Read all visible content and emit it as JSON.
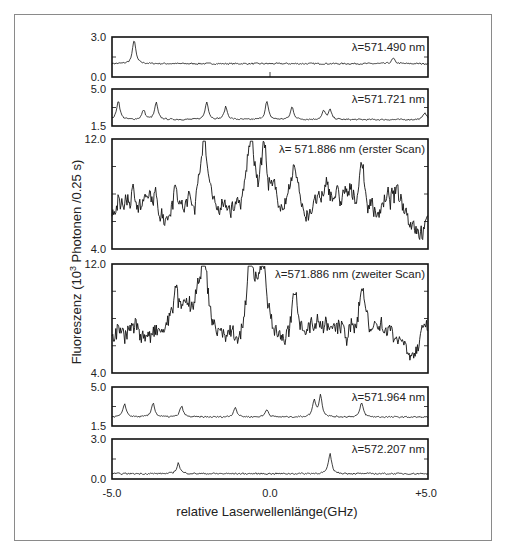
{
  "figure": {
    "ylabel": "Fluoreszenz (10³ Photonen /0.25 s)",
    "ylabel_parts": {
      "pre": "Fluoreszenz (10",
      "sup": "3",
      "post": " Photonen /0.25 s)"
    },
    "xlabel": "relative Laserwellenlänge(GHz)",
    "xticks": [
      "-5.0",
      "0.0",
      "+5.0"
    ]
  },
  "panels": [
    {
      "label": "λ=571.490 nm",
      "ymax": "3.0",
      "ymin": "0.0"
    },
    {
      "label": "λ=571.721 nm",
      "ymax": "5.0",
      "ymin": "1.5"
    },
    {
      "label": "λ= 571.886 nm (erster Scan)",
      "ymax": "12.0",
      "ymin": "4.0"
    },
    {
      "label": "λ=571.886 nm (zweiter Scan)",
      "ymax": "12.0",
      "ymin": "4.0"
    },
    {
      "label": "λ=571.964 nm",
      "ymax": "5.0",
      "ymin": "1.5"
    },
    {
      "label": "λ=572.207 nm",
      "ymax": "3.0",
      "ymin": "0.0"
    }
  ],
  "chart_data": {
    "type": "line",
    "title": "",
    "xlabel": "relative Laserwellenlänge(GHz)",
    "ylabel": "Fluoreszenz (10^3 Photonen /0.25 s)",
    "xlim": [
      -5.0,
      5.0
    ],
    "xticks": [
      -5.0,
      0.0,
      5.0
    ],
    "grid": false,
    "legend": "none (inline panel annotations)",
    "subplots": [
      {
        "annotation": "λ=571.490 nm",
        "ylim": [
          0.0,
          3.0
        ],
        "baseline": 1.0,
        "peaks": [
          {
            "x": -4.3,
            "y": 2.8
          },
          {
            "x": 3.9,
            "y": 1.4
          }
        ]
      },
      {
        "annotation": "λ=571.721 nm",
        "ylim": [
          1.5,
          5.0
        ],
        "baseline": 2.1,
        "peaks": [
          {
            "x": -4.8,
            "y": 3.9
          },
          {
            "x": -4.0,
            "y": 3.0
          },
          {
            "x": -3.6,
            "y": 3.7
          },
          {
            "x": -2.0,
            "y": 3.8
          },
          {
            "x": -1.4,
            "y": 3.3
          },
          {
            "x": -0.1,
            "y": 3.8
          },
          {
            "x": 0.7,
            "y": 3.3
          },
          {
            "x": 1.7,
            "y": 2.9
          },
          {
            "x": 1.9,
            "y": 3.0
          },
          {
            "x": 4.9,
            "y": 2.8
          }
        ]
      },
      {
        "annotation": "λ= 571.886 nm (erster Scan)",
        "ylim": [
          4.0,
          12.0
        ],
        "baseline": 7.0,
        "peaks": [
          {
            "x": -3.0,
            "y": 10.0
          },
          {
            "x": -2.1,
            "y": 12.0
          },
          {
            "x": -0.6,
            "y": 11.5
          },
          {
            "x": -0.2,
            "y": 11.0
          },
          {
            "x": 0.8,
            "y": 9.5
          },
          {
            "x": 2.9,
            "y": 11.0
          }
        ]
      },
      {
        "annotation": "λ=571.886 nm (zweiter Scan)",
        "ylim": [
          4.0,
          12.0
        ],
        "baseline": 7.0,
        "peaks": [
          {
            "x": -3.0,
            "y": 10.0
          },
          {
            "x": -2.1,
            "y": 12.5
          },
          {
            "x": -0.6,
            "y": 11.3
          },
          {
            "x": -0.2,
            "y": 11.0
          },
          {
            "x": 0.8,
            "y": 9.5
          },
          {
            "x": 2.9,
            "y": 11.0
          }
        ]
      },
      {
        "annotation": "λ=571.964 nm",
        "ylim": [
          1.5,
          5.0
        ],
        "baseline": 2.3,
        "peaks": [
          {
            "x": -4.6,
            "y": 3.5
          },
          {
            "x": -3.7,
            "y": 3.6
          },
          {
            "x": -2.8,
            "y": 3.3
          },
          {
            "x": -1.1,
            "y": 3.2
          },
          {
            "x": -0.1,
            "y": 3.0
          },
          {
            "x": 1.4,
            "y": 3.8
          },
          {
            "x": 1.6,
            "y": 4.2
          },
          {
            "x": 2.9,
            "y": 3.6
          }
        ]
      },
      {
        "annotation": "λ=572.207 nm",
        "ylim": [
          0.0,
          3.0
        ],
        "baseline": 0.4,
        "peaks": [
          {
            "x": -2.9,
            "y": 1.2
          },
          {
            "x": 1.9,
            "y": 1.9
          }
        ]
      }
    ]
  }
}
